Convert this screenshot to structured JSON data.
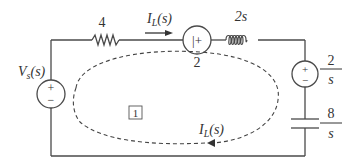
{
  "diagram": {
    "type": "s-domain circuit (mesh analysis)",
    "colors": {
      "wire": "#4a4a4a",
      "text": "#333333",
      "dashed_loop": "#444444",
      "background": "#ffffff"
    },
    "components": {
      "voltage_source": {
        "label_main": "V",
        "label_sub": "s",
        "label_arg": "(s)",
        "polarity_plus": "+",
        "polarity_minus": "−"
      },
      "resistor": {
        "value": "4"
      },
      "current_arrow_top": {
        "label_main": "I",
        "label_sub": "L",
        "label_arg": "(s)"
      },
      "dependent_source": {
        "inner": "|+",
        "value": "2"
      },
      "inductor": {
        "value": "2s"
      },
      "initial_condition_source": {
        "numerator": "2",
        "denominator": "s",
        "polarity_plus": "+",
        "polarity_minus": "−"
      },
      "capacitor": {
        "numerator": "8",
        "denominator": "s"
      }
    },
    "mesh": {
      "loop_label": "1",
      "current_label_main": "I",
      "current_label_sub": "L",
      "current_label_arg": "(s)",
      "direction": "clockwise"
    }
  }
}
